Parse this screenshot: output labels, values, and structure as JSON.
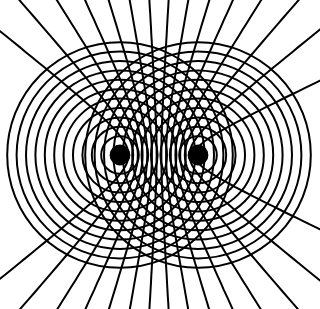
{
  "diagram": {
    "sources": [
      {
        "x": 120,
        "y": 155
      },
      {
        "x": 198,
        "y": 155
      }
    ],
    "ring_spacing": 9.4,
    "ring_count": 12,
    "colors": {
      "line": "#000000",
      "background": "#ffffff"
    }
  }
}
